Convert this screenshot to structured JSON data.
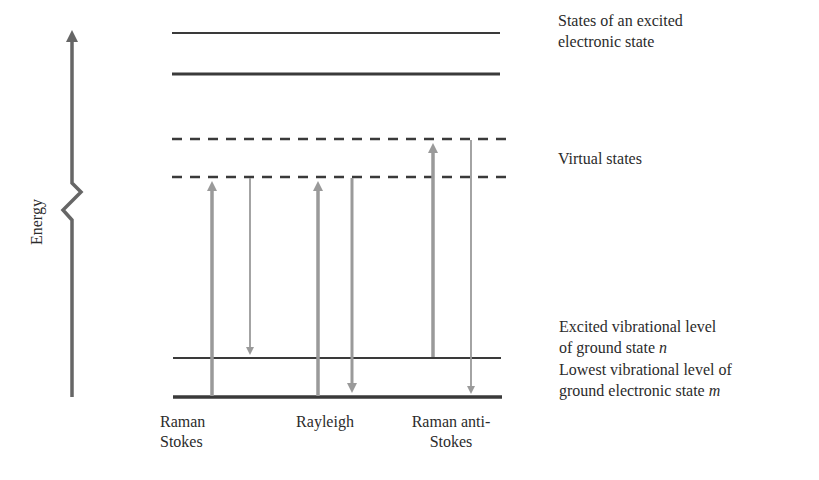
{
  "axis": {
    "label": "Energy"
  },
  "levels": {
    "excited_electronic": {
      "label_line1": "States of an excited",
      "label_line2": "electronic state"
    },
    "virtual": {
      "label": "Virtual states"
    },
    "excited_vibrational": {
      "label_line1": "Excited vibrational level",
      "label_line2_prefix": "of ground state ",
      "label_symbol": "n"
    },
    "lowest_vibrational": {
      "label_line1": "Lowest vibrational level of",
      "label_line2_prefix": "ground electronic state ",
      "label_symbol": "m"
    }
  },
  "processes": [
    {
      "name": "Raman Stokes",
      "line1": "Raman",
      "line2": "Stokes"
    },
    {
      "name": "Rayleigh",
      "line1": "Rayleigh",
      "line2": ""
    },
    {
      "name": "Raman anti-Stokes",
      "line1": "Raman anti-",
      "line2": "Stokes"
    }
  ],
  "colors": {
    "level_line": "#3a3a3a",
    "transition_arrow": "#9a9a9a",
    "axis": "#666666"
  }
}
